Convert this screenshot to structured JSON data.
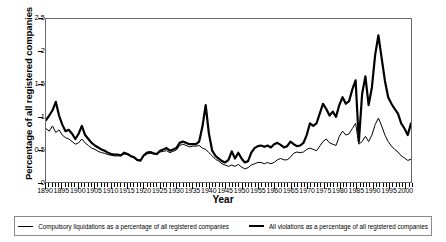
{
  "chart_data": {
    "type": "line",
    "title": "",
    "xlabel": "Year",
    "ylabel": "Percentage of all registered companies",
    "xlim": [
      1890,
      2002
    ],
    "ylim": [
      0,
      2.5
    ],
    "yticks": [
      0,
      0.5,
      1,
      1.5,
      2,
      2.5
    ],
    "ytick_labels": [
      "0",
      "0.5",
      "1",
      "1.5",
      "2",
      "2.5"
    ],
    "xticks": [
      1890,
      1895,
      1900,
      1905,
      1910,
      1915,
      1920,
      1925,
      1930,
      1935,
      1940,
      1945,
      1950,
      1955,
      1960,
      1965,
      1970,
      1975,
      1980,
      1985,
      1990,
      1995,
      2000
    ],
    "xtick_labels": [
      "1890",
      "1895",
      "1900",
      "1905",
      "1910",
      "1915",
      "1920",
      "1925",
      "1930",
      "1935",
      "1940",
      "1945",
      "1950",
      "1955",
      "1960",
      "1965",
      "1970",
      "1975",
      "1980",
      "1985",
      "1990",
      "1995",
      "2000"
    ],
    "minor_tick_interval": 1,
    "grid": false,
    "legend_position": "below",
    "line_color": "#000000",
    "frame_color": "#6a6a6a",
    "x": [
      1890,
      1891,
      1892,
      1893,
      1894,
      1895,
      1896,
      1897,
      1898,
      1899,
      1900,
      1901,
      1902,
      1903,
      1904,
      1905,
      1906,
      1907,
      1908,
      1909,
      1910,
      1911,
      1912,
      1913,
      1914,
      1915,
      1916,
      1917,
      1918,
      1919,
      1920,
      1921,
      1922,
      1923,
      1924,
      1925,
      1926,
      1927,
      1928,
      1929,
      1930,
      1931,
      1932,
      1933,
      1934,
      1935,
      1936,
      1937,
      1938,
      1939,
      1940,
      1941,
      1942,
      1943,
      1944,
      1945,
      1946,
      1947,
      1948,
      1949,
      1950,
      1951,
      1952,
      1953,
      1954,
      1955,
      1956,
      1957,
      1958,
      1959,
      1960,
      1961,
      1962,
      1963,
      1964,
      1965,
      1966,
      1967,
      1968,
      1969,
      1970,
      1971,
      1972,
      1973,
      1974,
      1975,
      1976,
      1977,
      1978,
      1979,
      1980,
      1981,
      1982,
      1983,
      1984,
      1985,
      1986,
      1987,
      1988,
      1989,
      1990,
      1991,
      1992,
      1993,
      1994,
      1995,
      1996,
      1997,
      1998,
      1999,
      2000,
      2001,
      2002
    ],
    "series": [
      {
        "name": "All violations as a percentage of all registered companies",
        "style": "thick",
        "width_px": 2.2,
        "values": [
          0.95,
          1.02,
          1.1,
          1.23,
          1.02,
          0.88,
          0.78,
          0.8,
          0.74,
          0.66,
          0.74,
          0.86,
          0.72,
          0.66,
          0.6,
          0.56,
          0.53,
          0.5,
          0.48,
          0.45,
          0.43,
          0.42,
          0.42,
          0.41,
          0.45,
          0.43,
          0.4,
          0.38,
          0.34,
          0.33,
          0.41,
          0.45,
          0.46,
          0.44,
          0.43,
          0.48,
          0.5,
          0.52,
          0.48,
          0.5,
          0.52,
          0.6,
          0.62,
          0.6,
          0.58,
          0.58,
          0.58,
          0.62,
          0.85,
          1.18,
          0.74,
          0.48,
          0.4,
          0.36,
          0.32,
          0.3,
          0.34,
          0.47,
          0.36,
          0.45,
          0.36,
          0.3,
          0.32,
          0.45,
          0.52,
          0.55,
          0.56,
          0.54,
          0.56,
          0.53,
          0.58,
          0.6,
          0.57,
          0.53,
          0.55,
          0.62,
          0.58,
          0.55,
          0.56,
          0.6,
          0.72,
          0.9,
          0.86,
          0.9,
          1.05,
          1.2,
          1.12,
          1.02,
          1.08,
          1.0,
          1.18,
          1.3,
          1.2,
          1.24,
          1.42,
          1.56,
          0.62,
          1.35,
          1.62,
          1.18,
          1.45,
          1.95,
          2.25,
          1.9,
          1.55,
          1.3,
          1.2,
          1.12,
          1.05,
          0.9,
          0.82,
          0.72,
          0.9
        ]
      },
      {
        "name": "Compulsory liquidations as a percentage of all registered companies",
        "style": "thin",
        "width_px": 1.0,
        "values": [
          0.82,
          0.78,
          0.86,
          0.76,
          0.8,
          0.72,
          0.68,
          0.66,
          0.62,
          0.58,
          0.6,
          0.66,
          0.6,
          0.56,
          0.52,
          0.5,
          0.47,
          0.45,
          0.44,
          0.42,
          0.41,
          0.4,
          0.4,
          0.4,
          0.43,
          0.42,
          0.39,
          0.37,
          0.33,
          0.32,
          0.4,
          0.43,
          0.44,
          0.43,
          0.42,
          0.46,
          0.47,
          0.48,
          0.45,
          0.47,
          0.49,
          0.56,
          0.58,
          0.56,
          0.54,
          0.55,
          0.55,
          0.56,
          0.52,
          0.5,
          0.45,
          0.4,
          0.35,
          0.32,
          0.28,
          0.26,
          0.24,
          0.26,
          0.24,
          0.27,
          0.23,
          0.2,
          0.22,
          0.26,
          0.28,
          0.3,
          0.3,
          0.28,
          0.3,
          0.28,
          0.3,
          0.34,
          0.36,
          0.34,
          0.34,
          0.38,
          0.44,
          0.46,
          0.45,
          0.46,
          0.5,
          0.52,
          0.5,
          0.48,
          0.55,
          0.62,
          0.66,
          0.6,
          0.58,
          0.56,
          0.7,
          0.78,
          0.72,
          0.74,
          0.82,
          0.9,
          0.58,
          0.62,
          0.7,
          0.62,
          0.72,
          0.88,
          0.98,
          0.86,
          0.72,
          0.62,
          0.55,
          0.5,
          0.46,
          0.4,
          0.37,
          0.33,
          0.35
        ]
      }
    ]
  },
  "legend": {
    "items": [
      {
        "label": "Compulsory liquidations as a percentage of all registered companies",
        "style": "thin"
      },
      {
        "label": "All violations as a percentage of all registered companies",
        "style": "thick"
      }
    ]
  }
}
